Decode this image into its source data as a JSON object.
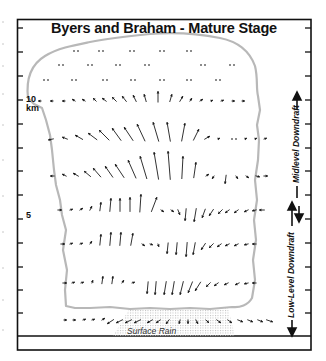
{
  "title": "Byers and Braham - Mature Stage",
  "axis": {
    "label_10": "10",
    "label_km": "km",
    "label_5": "5"
  },
  "side_labels": {
    "midlevel": "Midlevel Downdraft",
    "lowlevel": "Low-Level Downdraft"
  },
  "surface_label": "Surface Rain",
  "colors": {
    "frame": "#111111",
    "cloud_outline": "#b8b8b8",
    "arrow": "#1a1a1a",
    "rain": "#c8c8c8"
  },
  "arrow_rows": [
    {
      "y": 51,
      "arrows": [
        [
          76,
          0,
          0
        ],
        [
          101,
          0,
          0
        ],
        [
          132,
          0,
          0
        ],
        [
          162,
          0,
          0
        ],
        [
          189,
          0,
          0
        ]
      ]
    },
    {
      "y": 65,
      "arrows": [
        [
          61,
          0,
          0
        ],
        [
          90,
          0,
          0
        ],
        [
          118,
          0,
          0
        ],
        [
          147,
          0,
          0
        ],
        [
          203,
          0,
          0
        ],
        [
          232,
          0,
          0
        ]
      ]
    },
    {
      "y": 80,
      "arrows": [
        [
          46,
          0,
          0
        ],
        [
          74,
          0,
          0
        ],
        [
          105,
          0,
          0
        ],
        [
          133,
          0,
          0
        ],
        [
          162,
          0,
          0
        ],
        [
          189,
          0,
          0
        ],
        [
          218,
          0,
          0
        ]
      ]
    },
    {
      "y": 101,
      "arrows": [
        [
          41,
          -3,
          0
        ],
        [
          53,
          -3,
          0
        ],
        [
          65,
          -3,
          0
        ],
        [
          75,
          -3,
          -2
        ],
        [
          85,
          -3,
          -2
        ],
        [
          96,
          -3,
          -3
        ],
        [
          106,
          -4,
          -3
        ],
        [
          116,
          -4,
          -4
        ],
        [
          126,
          -4,
          -5
        ],
        [
          136,
          -3,
          -6
        ],
        [
          146,
          -2,
          -7
        ],
        [
          158,
          0,
          -10
        ],
        [
          170,
          2,
          -7
        ],
        [
          180,
          3,
          -5
        ],
        [
          190,
          2,
          -3
        ],
        [
          200,
          3,
          -2
        ],
        [
          211,
          2,
          -1
        ],
        [
          221,
          3,
          -1
        ],
        [
          232,
          3,
          0
        ],
        [
          242,
          3,
          0
        ]
      ]
    },
    {
      "y": 139,
      "arrows": [
        [
          53,
          -5,
          1
        ],
        [
          67,
          -5,
          -2
        ],
        [
          82,
          -7,
          -4
        ],
        [
          96,
          -8,
          -6
        ],
        [
          108,
          -9,
          -9
        ],
        [
          120,
          -8,
          -11
        ],
        [
          132,
          -8,
          -12
        ],
        [
          144,
          -7,
          -15
        ],
        [
          158,
          -5,
          -17
        ],
        [
          170,
          -3,
          -17
        ],
        [
          182,
          3,
          -16
        ],
        [
          194,
          5,
          -10
        ],
        [
          205,
          5,
          -3
        ],
        [
          218,
          2,
          -1
        ],
        [
          234,
          0,
          0
        ],
        [
          245,
          2,
          -1
        ],
        [
          255,
          2,
          -1
        ],
        [
          264,
          3,
          -1
        ]
      ]
    },
    {
      "y": 176,
      "arrows": [
        [
          54,
          -4,
          0
        ],
        [
          66,
          -4,
          -2
        ],
        [
          78,
          -5,
          -3
        ],
        [
          90,
          -6,
          -5
        ],
        [
          100,
          -7,
          -8
        ],
        [
          112,
          -7,
          -10
        ],
        [
          123,
          -8,
          -12
        ],
        [
          135,
          -7,
          -16
        ],
        [
          146,
          -6,
          -20
        ],
        [
          158,
          -4,
          -24
        ],
        [
          170,
          -2,
          -25
        ],
        [
          182,
          1,
          -20
        ],
        [
          194,
          2,
          -14
        ],
        [
          206,
          3,
          -2
        ],
        [
          214,
          -2,
          3
        ],
        [
          226,
          -1,
          8
        ],
        [
          236,
          2,
          3
        ],
        [
          246,
          3,
          2
        ],
        [
          256,
          4,
          1
        ],
        [
          264,
          4,
          0
        ]
      ]
    },
    {
      "y": 210,
      "arrows": [
        [
          58,
          4,
          0
        ],
        [
          70,
          3,
          -1
        ],
        [
          80,
          3,
          -2
        ],
        [
          90,
          2,
          -4
        ],
        [
          100,
          1,
          -8
        ],
        [
          110,
          1,
          -12
        ],
        [
          120,
          0,
          -12
        ],
        [
          130,
          0,
          -13
        ],
        [
          140,
          1,
          -16
        ],
        [
          152,
          5,
          -13
        ],
        [
          161,
          3,
          2
        ],
        [
          171,
          3,
          2
        ],
        [
          178,
          2,
          5
        ],
        [
          186,
          -1,
          11
        ],
        [
          196,
          -2,
          12
        ],
        [
          205,
          -3,
          8
        ],
        [
          213,
          -4,
          6
        ],
        [
          222,
          -4,
          4
        ],
        [
          229,
          -4,
          3
        ],
        [
          238,
          -4,
          3
        ],
        [
          248,
          -4,
          2
        ],
        [
          256,
          -4,
          1
        ],
        [
          264,
          -5,
          0
        ]
      ]
    },
    {
      "y": 244,
      "arrows": [
        [
          61,
          4,
          0
        ],
        [
          70,
          3,
          -1
        ],
        [
          80,
          3,
          -1
        ],
        [
          90,
          2,
          -3
        ],
        [
          100,
          1,
          -10
        ],
        [
          110,
          1,
          -12
        ],
        [
          120,
          1,
          -12
        ],
        [
          131,
          2,
          -11
        ],
        [
          142,
          3,
          2
        ],
        [
          150,
          3,
          1
        ],
        [
          158,
          1,
          3
        ],
        [
          168,
          -1,
          10
        ],
        [
          177,
          -1,
          11
        ],
        [
          187,
          -1,
          13
        ],
        [
          195,
          -2,
          11
        ],
        [
          205,
          -4,
          6
        ],
        [
          213,
          -4,
          4
        ],
        [
          221,
          -4,
          3
        ],
        [
          229,
          -4,
          2
        ],
        [
          238,
          -4,
          2
        ],
        [
          248,
          -4,
          1
        ],
        [
          256,
          -4,
          0
        ]
      ]
    },
    {
      "y": 283,
      "arrows": [
        [
          63,
          4,
          0
        ],
        [
          72,
          3,
          -1
        ],
        [
          81,
          3,
          -1
        ],
        [
          92,
          1,
          -3
        ],
        [
          102,
          1,
          -7
        ],
        [
          112,
          1,
          -7
        ],
        [
          122,
          2,
          -3
        ],
        [
          132,
          3,
          -1
        ],
        [
          148,
          -1,
          11
        ],
        [
          156,
          -1,
          12
        ],
        [
          166,
          -2,
          12
        ],
        [
          174,
          -2,
          12
        ],
        [
          183,
          -3,
          12
        ],
        [
          192,
          -4,
          10
        ],
        [
          200,
          -5,
          8
        ],
        [
          210,
          -4,
          4
        ],
        [
          218,
          -4,
          3
        ],
        [
          228,
          -4,
          2
        ],
        [
          239,
          -4,
          2
        ],
        [
          248,
          -4,
          1
        ],
        [
          256,
          -4,
          0
        ]
      ]
    },
    {
      "y": 320,
      "arrows": [
        [
          64,
          3,
          0
        ],
        [
          73,
          3,
          0
        ],
        [
          83,
          3,
          -1
        ],
        [
          92,
          3,
          -1
        ],
        [
          102,
          3,
          -2
        ],
        [
          113,
          -6,
          4
        ],
        [
          122,
          -6,
          3
        ],
        [
          131,
          -6,
          3
        ],
        [
          140,
          -6,
          3
        ],
        [
          152,
          -5,
          3
        ],
        [
          160,
          -4,
          3
        ],
        [
          169,
          -3,
          4
        ],
        [
          180,
          -1,
          4
        ],
        [
          188,
          0,
          4
        ],
        [
          196,
          2,
          4
        ],
        [
          206,
          3,
          3
        ],
        [
          217,
          4,
          3
        ],
        [
          228,
          4,
          3
        ],
        [
          238,
          5,
          2
        ],
        [
          248,
          5,
          2
        ],
        [
          258,
          5,
          2
        ],
        [
          267,
          6,
          2
        ]
      ]
    }
  ]
}
